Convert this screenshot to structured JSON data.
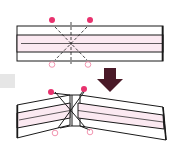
{
  "diagram": {
    "colors": {
      "paper_outline": "#1a1a1a",
      "paper_white": "#ffffff",
      "paper_pink": "#fbe9f1",
      "marker_filled": "#e8326e",
      "marker_hollow": "#f08aa8",
      "arrow": "#4a1a28",
      "gray_tab": "#e6e6e6"
    },
    "step_before": {
      "label": "flat strip with crease marks",
      "markers": [
        {
          "type": "filled",
          "x": 52,
          "y": 20
        },
        {
          "type": "filled",
          "x": 90,
          "y": 20
        },
        {
          "type": "hollow",
          "x": 52,
          "y": 64
        },
        {
          "type": "hollow",
          "x": 88,
          "y": 64
        }
      ]
    },
    "arrow": {
      "direction": "down"
    },
    "step_after": {
      "label": "strip folded into V",
      "markers": [
        {
          "type": "filled",
          "x": 51,
          "y": 92
        },
        {
          "type": "filled",
          "x": 84,
          "y": 89
        },
        {
          "type": "hollow",
          "x": 55,
          "y": 133
        },
        {
          "type": "hollow",
          "x": 90,
          "y": 132
        }
      ]
    }
  }
}
